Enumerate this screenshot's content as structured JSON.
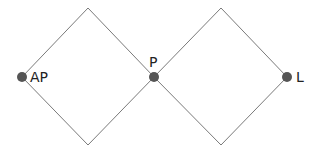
{
  "diagram": {
    "type": "network-diamond-chain",
    "colors": {
      "background": "#ffffff",
      "edge": "#7a7a7a",
      "node": "#555555",
      "label": "#222222"
    },
    "nodes": [
      {
        "id": "AP",
        "label": "AP",
        "x": 22,
        "y": 77,
        "label_position": "right"
      },
      {
        "id": "P",
        "label": "P",
        "x": 154,
        "y": 77,
        "label_position": "top"
      },
      {
        "id": "L",
        "label": "L",
        "x": 287,
        "y": 77,
        "label_position": "right"
      }
    ],
    "vertices": [
      {
        "id": "top-left",
        "x": 88,
        "y": 8
      },
      {
        "id": "bottom-left",
        "x": 88,
        "y": 145
      },
      {
        "id": "top-right",
        "x": 221,
        "y": 8
      },
      {
        "id": "bottom-right",
        "x": 221,
        "y": 145
      }
    ],
    "edges": [
      {
        "from": "AP",
        "to": "top-left"
      },
      {
        "from": "AP",
        "to": "bottom-left"
      },
      {
        "from": "top-left",
        "to": "P"
      },
      {
        "from": "bottom-left",
        "to": "P"
      },
      {
        "from": "P",
        "to": "top-right"
      },
      {
        "from": "P",
        "to": "bottom-right"
      },
      {
        "from": "top-right",
        "to": "L"
      },
      {
        "from": "bottom-right",
        "to": "L"
      }
    ]
  }
}
